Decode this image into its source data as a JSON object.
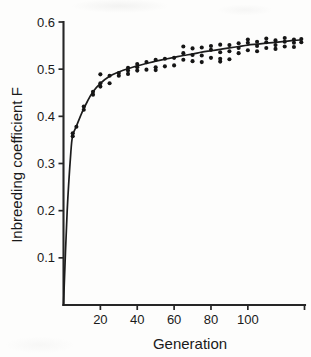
{
  "figure": {
    "background_color": "#fdfdfc",
    "ink_color": "#1a1a1a"
  },
  "chart_data": {
    "type": "scatter",
    "title": "",
    "subtitle": "",
    "xlabel": "Generation",
    "ylabel": "Inbreeding coefficient F",
    "xlim": [
      0,
      131
    ],
    "ylim": [
      0,
      0.6
    ],
    "xticks": [
      20,
      40,
      60,
      80,
      100
    ],
    "xticklabels": [
      "20",
      "40",
      "60",
      "80",
      "100"
    ],
    "yticks": [
      0.1,
      0.2,
      0.3,
      0.4,
      0.5,
      0.6
    ],
    "yticklabels": [
      "0.1",
      "0.2",
      "0.3",
      "0.4",
      "0.5",
      "0.6"
    ],
    "grid": false,
    "legend": null,
    "legend_position": "none",
    "axis_style": "open-left-bottom",
    "marker": "filled-circle",
    "marker_size_px": 3.0,
    "series": [
      {
        "name": "observed F",
        "type": "scatter",
        "points": [
          [
            5,
            0.358
          ],
          [
            5,
            0.364
          ],
          [
            7,
            0.378
          ],
          [
            11,
            0.421
          ],
          [
            11,
            0.414
          ],
          [
            16,
            0.452
          ],
          [
            16,
            0.446
          ],
          [
            20,
            0.489
          ],
          [
            20,
            0.47
          ],
          [
            20,
            0.463
          ],
          [
            25,
            0.486
          ],
          [
            25,
            0.47
          ],
          [
            30,
            0.492
          ],
          [
            30,
            0.486
          ],
          [
            35,
            0.503
          ],
          [
            35,
            0.497
          ],
          [
            35,
            0.49
          ],
          [
            40,
            0.511
          ],
          [
            40,
            0.504
          ],
          [
            40,
            0.497
          ],
          [
            45,
            0.515
          ],
          [
            45,
            0.499
          ],
          [
            50,
            0.52
          ],
          [
            50,
            0.504
          ],
          [
            50,
            0.498
          ],
          [
            55,
            0.522
          ],
          [
            55,
            0.506
          ],
          [
            60,
            0.524
          ],
          [
            60,
            0.508
          ],
          [
            65,
            0.548
          ],
          [
            65,
            0.534
          ],
          [
            65,
            0.52
          ],
          [
            70,
            0.544
          ],
          [
            70,
            0.53
          ],
          [
            70,
            0.517
          ],
          [
            75,
            0.546
          ],
          [
            75,
            0.529
          ],
          [
            75,
            0.515
          ],
          [
            80,
            0.549
          ],
          [
            80,
            0.541
          ],
          [
            80,
            0.524
          ],
          [
            85,
            0.552
          ],
          [
            85,
            0.536
          ],
          [
            85,
            0.522
          ],
          [
            85,
            0.516
          ],
          [
            90,
            0.551
          ],
          [
            90,
            0.538
          ],
          [
            90,
            0.521
          ],
          [
            95,
            0.555
          ],
          [
            95,
            0.545
          ],
          [
            95,
            0.534
          ],
          [
            100,
            0.563
          ],
          [
            100,
            0.556
          ],
          [
            100,
            0.54
          ],
          [
            105,
            0.558
          ],
          [
            105,
            0.549
          ],
          [
            105,
            0.538
          ],
          [
            110,
            0.565
          ],
          [
            110,
            0.557
          ],
          [
            110,
            0.545
          ],
          [
            115,
            0.561
          ],
          [
            115,
            0.551
          ],
          [
            115,
            0.543
          ],
          [
            120,
            0.566
          ],
          [
            120,
            0.558
          ],
          [
            120,
            0.548
          ],
          [
            125,
            0.563
          ],
          [
            125,
            0.556
          ],
          [
            125,
            0.547
          ],
          [
            129,
            0.564
          ],
          [
            129,
            0.557
          ]
        ]
      },
      {
        "name": "fitted curve",
        "type": "line",
        "description": "asymptotic rise from 0 to approximately 0.57",
        "points": [
          [
            0,
            0.0
          ],
          [
            2,
            0.2
          ],
          [
            4,
            0.325
          ],
          [
            5,
            0.36
          ],
          [
            7,
            0.379
          ],
          [
            10,
            0.408
          ],
          [
            13,
            0.432
          ],
          [
            16,
            0.452
          ],
          [
            20,
            0.47
          ],
          [
            25,
            0.485
          ],
          [
            30,
            0.494
          ],
          [
            35,
            0.501
          ],
          [
            40,
            0.507
          ],
          [
            45,
            0.512
          ],
          [
            50,
            0.517
          ],
          [
            55,
            0.521
          ],
          [
            60,
            0.525
          ],
          [
            65,
            0.529
          ],
          [
            70,
            0.532
          ],
          [
            75,
            0.536
          ],
          [
            80,
            0.539
          ],
          [
            85,
            0.542
          ],
          [
            90,
            0.545
          ],
          [
            95,
            0.548
          ],
          [
            100,
            0.551
          ],
          [
            105,
            0.553
          ],
          [
            110,
            0.555
          ],
          [
            115,
            0.557
          ],
          [
            120,
            0.559
          ],
          [
            125,
            0.561
          ],
          [
            129,
            0.562
          ]
        ]
      }
    ]
  }
}
